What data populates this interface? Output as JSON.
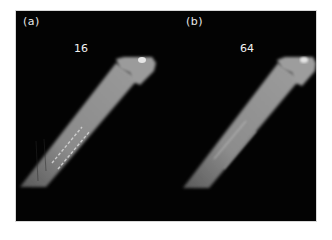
{
  "figure": {
    "background": "#030303",
    "panels": [
      {
        "id": "a",
        "label": "(a)",
        "value": "16",
        "rod_color": "#8a8a8a",
        "streaks": "prominent"
      },
      {
        "id": "b",
        "label": "(b)",
        "value": "64",
        "rod_color": "#8c8c8c",
        "streaks": "faint"
      }
    ]
  }
}
